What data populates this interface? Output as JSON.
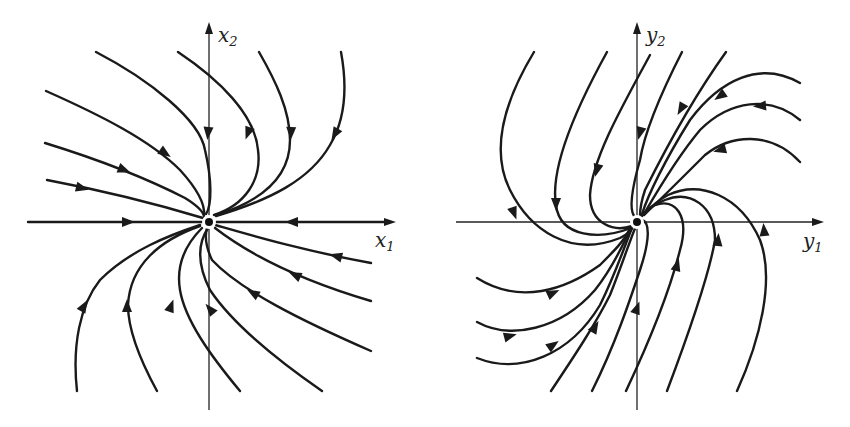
{
  "figure": {
    "panels": [
      {
        "id": "left",
        "axis_labels": {
          "horizontal": "x",
          "horizontal_sub": "1",
          "vertical": "x",
          "vertical_sub": "2"
        },
        "origin": [
          209,
          221
        ],
        "h_axis": [
          28,
          390
        ],
        "v_axis": [
          28,
          410
        ],
        "h_label_pos": [
          375,
          247
        ],
        "v_label_pos": [
          218,
          42
        ],
        "trajectories": [
          {
            "d": "M96,52 C150,80 200,120 205,150 C212,180 212,205 206,214",
            "arrow": [
              208,
              133,
              95
            ]
          },
          {
            "d": "M178,52 C220,80 255,115 258,150 C262,180 245,205 214,215",
            "arrow": [
              248,
              133,
              110
            ]
          },
          {
            "d": "M259,52 C275,80 290,110 290,140 C290,175 265,200 216,215",
            "arrow": [
              291,
              133,
              92
            ]
          },
          {
            "d": "M341,52 C348,90 345,120 330,145 C310,180 270,200 216,216",
            "arrow": [
              335,
              134,
              120
            ]
          },
          {
            "d": "M46,91 C100,115 150,140 180,170 C200,192 205,205 204,215",
            "arrow": [
              165,
              153,
              35
            ]
          },
          {
            "d": "M45,143 C100,160 150,180 185,198 C198,206 203,212 204,216",
            "arrow": [
              124,
              170,
              22
            ]
          },
          {
            "d": "M47,180 C100,190 160,205 203,218",
            "arrow": [
              82,
              188,
              14
            ]
          },
          {
            "d": "M28,222 L203,222",
            "arrow": [
              128,
              222,
              0
            ],
            "stroke": "axis-overlay"
          },
          {
            "d": "M390,222 L216,222",
            "arrow": [
              292,
              222,
              180
            ],
            "stroke": "axis-overlay"
          },
          {
            "d": "M371,263 C300,250 250,235 215,225",
            "arrow": [
              336,
              256,
              195
            ]
          },
          {
            "d": "M371,301 C300,280 250,255 215,228",
            "arrow": [
              295,
              275,
              205
            ]
          },
          {
            "d": "M371,351 C300,320 240,290 212,260 C205,245 205,235 207,228",
            "arrow": [
              253,
              293,
              210
            ]
          },
          {
            "d": "M322,391 C270,355 230,320 210,290 C195,260 200,240 208,228",
            "arrow": [
              210,
              309,
              230
            ]
          },
          {
            "d": "M240,391 C210,355 185,320 180,290 C175,260 190,240 202,228",
            "arrow": [
              171,
              306,
              290
            ]
          },
          {
            "d": "M157,391 C140,360 128,330 128,305 C130,265 160,240 200,226",
            "arrow": [
              127,
              306,
              270
            ]
          },
          {
            "d": "M77,391 C72,345 80,305 100,280 C130,250 170,235 200,225",
            "arrow": [
              84,
              306,
              300
            ]
          }
        ]
      },
      {
        "id": "right",
        "axis_labels": {
          "horizontal": "y",
          "horizontal_sub": "1",
          "vertical": "y",
          "vertical_sub": "2"
        },
        "origin": [
          637,
          221
        ],
        "h_axis": [
          456,
          818
        ],
        "v_axis": [
          28,
          410
        ],
        "h_label_pos": [
          803,
          248
        ],
        "v_label_pos": [
          646,
          42
        ],
        "trajectories": [
          {
            "d": "M534,52 C505,100 490,150 510,190 C530,230 570,258 620,238 C628,234 632,230 633,226",
            "arrow": [
              514,
              213,
              70
            ]
          },
          {
            "d": "M607,52 C575,110 550,170 556,205 C560,238 600,240 631,228",
            "arrow": [
              556,
              204,
              90
            ]
          },
          {
            "d": "M650,55 C620,110 592,160 590,195 C590,225 615,232 632,226",
            "arrow": [
              597,
              170,
              105
            ]
          },
          {
            "d": "M682,52 C660,95 645,130 640,160 C630,195 630,210 634,216",
            "arrow": [
              640,
              133,
              105
            ]
          },
          {
            "d": "M726,52 C695,95 665,150 645,190 C640,205 640,212 640,216",
            "arrow": [
              681,
              109,
              120
            ]
          },
          {
            "d": "M800,83 C760,60 720,80 690,120 C665,160 648,195 642,214",
            "arrow": [
              720,
              96,
              145
            ]
          },
          {
            "d": "M800,120 C770,95 730,100 700,130 C675,160 655,195 644,214",
            "arrow": [
              760,
              106,
              175
            ]
          },
          {
            "d": "M800,162 C770,130 730,135 705,155 C680,180 660,200 644,215",
            "arrow": [
              720,
              150,
              165
            ]
          },
          {
            "d": "M737,391 C760,340 775,280 760,240 C740,195 700,180 668,195 C655,202 648,210 644,214",
            "arrow": [
              764,
              230,
              265
            ]
          },
          {
            "d": "M667,391 C690,330 710,270 715,240 C715,205 690,190 665,200 C652,205 646,210 642,216",
            "arrow": [
              718,
              240,
              275
            ]
          },
          {
            "d": "M626,391 C650,340 670,290 680,250 C690,215 675,198 655,205 C646,210 643,214 640,218",
            "arrow": [
              677,
              265,
              285
            ]
          },
          {
            "d": "M592,391 C615,345 630,300 640,270 C650,240 650,222 642,220",
            "arrow": [
              637,
              308,
              290
            ]
          },
          {
            "d": "M551,391 C575,355 595,325 610,295 C622,265 630,240 636,226",
            "arrow": [
              595,
              327,
              300
            ]
          },
          {
            "d": "M477,358 C520,375 570,355 600,305 C615,275 625,245 632,228",
            "arrow": [
              553,
              345,
              325
            ]
          },
          {
            "d": "M477,322 C510,340 560,330 595,290 C615,265 625,240 632,226",
            "arrow": [
              510,
              336,
              345
            ]
          },
          {
            "d": "M477,278 C520,305 565,290 600,265 C615,250 625,240 630,228",
            "arrow": [
              553,
              293,
              335
            ]
          }
        ]
      }
    ],
    "origin_marker": {
      "radius": 4,
      "halo_radius": 7
    }
  }
}
